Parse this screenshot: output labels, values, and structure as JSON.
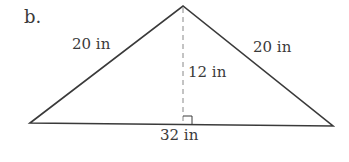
{
  "figure": {
    "part_label": "b.",
    "shape": "triangle",
    "labels": {
      "left_side": "20 in",
      "right_side": "20 in",
      "height": "12 in",
      "base": "32 in"
    },
    "colors": {
      "line": "#3a3a3a",
      "dashed": "#888888",
      "background": "#ffffff"
    }
  }
}
